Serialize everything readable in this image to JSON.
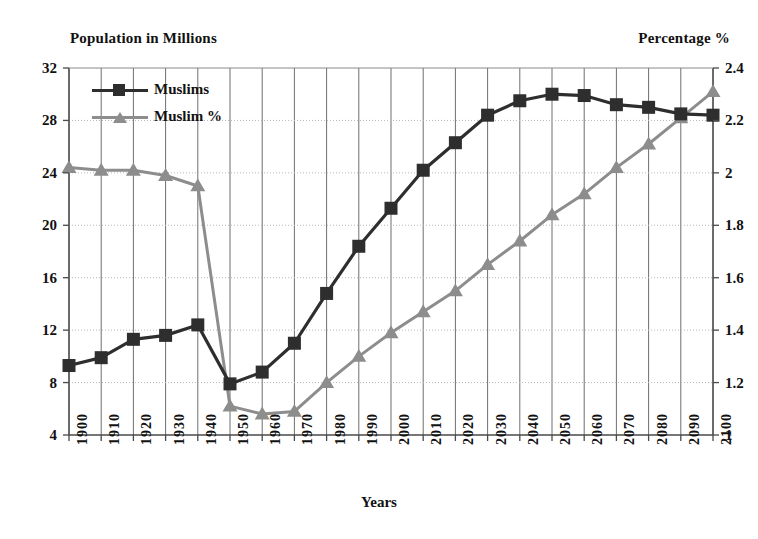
{
  "chart_data": {
    "type": "line",
    "title": "",
    "xlabel": "Years",
    "ylabel": "Population in Millions",
    "y2label": "Percentage %",
    "grid": true,
    "legend_position": "top-left",
    "x": [
      1900,
      1910,
      1920,
      1930,
      1940,
      1950,
      1960,
      1970,
      1980,
      1990,
      2000,
      2010,
      2020,
      2030,
      2040,
      2050,
      2060,
      2070,
      2080,
      2090,
      2100
    ],
    "xtick_labels": [
      "1900",
      "1910",
      "1920",
      "1930",
      "1940",
      "1950",
      "1960",
      "1970",
      "1980",
      "1990",
      "2000",
      "2010",
      "2020",
      "2030",
      "2040",
      "2050",
      "2060",
      "2070",
      "2080",
      "2090",
      "2100"
    ],
    "ylim": [
      4,
      32
    ],
    "ytick_labels": [
      "4",
      "8",
      "12",
      "16",
      "20",
      "24",
      "28",
      "32"
    ],
    "ytick_values": [
      4,
      8,
      12,
      16,
      20,
      24,
      28,
      32
    ],
    "y2lim": [
      1,
      2.4
    ],
    "y2tick_labels": [
      "1",
      "1.2",
      "1.4",
      "1.6",
      "1.8",
      "2",
      "2.2",
      "2.4"
    ],
    "y2tick_values": [
      1,
      1.2,
      1.4,
      1.6,
      1.8,
      2,
      2.2,
      2.4
    ],
    "series": [
      {
        "name": "Muslims",
        "axis": "left",
        "marker": "square",
        "color": "#2e2e2e",
        "values": [
          9.3,
          9.9,
          11.3,
          11.6,
          12.4,
          7.9,
          8.8,
          11.0,
          14.8,
          18.4,
          21.3,
          24.2,
          26.3,
          28.4,
          29.5,
          30.0,
          29.9,
          29.2,
          29.0,
          28.5,
          28.4
        ]
      },
      {
        "name": "Muslim %",
        "axis": "right",
        "marker": "triangle",
        "color": "#8d8d8d",
        "values": [
          2.02,
          2.01,
          2.01,
          1.99,
          1.95,
          1.11,
          1.08,
          1.09,
          1.2,
          1.3,
          1.39,
          1.47,
          1.55,
          1.65,
          1.74,
          1.84,
          1.92,
          2.02,
          2.11,
          2.21,
          2.31
        ]
      }
    ]
  },
  "legend": {
    "items": [
      {
        "label": "Muslims"
      },
      {
        "label": "Muslim %"
      }
    ]
  },
  "axes": {
    "left_title": "Population in Millions",
    "right_title": "Percentage %",
    "bottom_title": "Years"
  }
}
